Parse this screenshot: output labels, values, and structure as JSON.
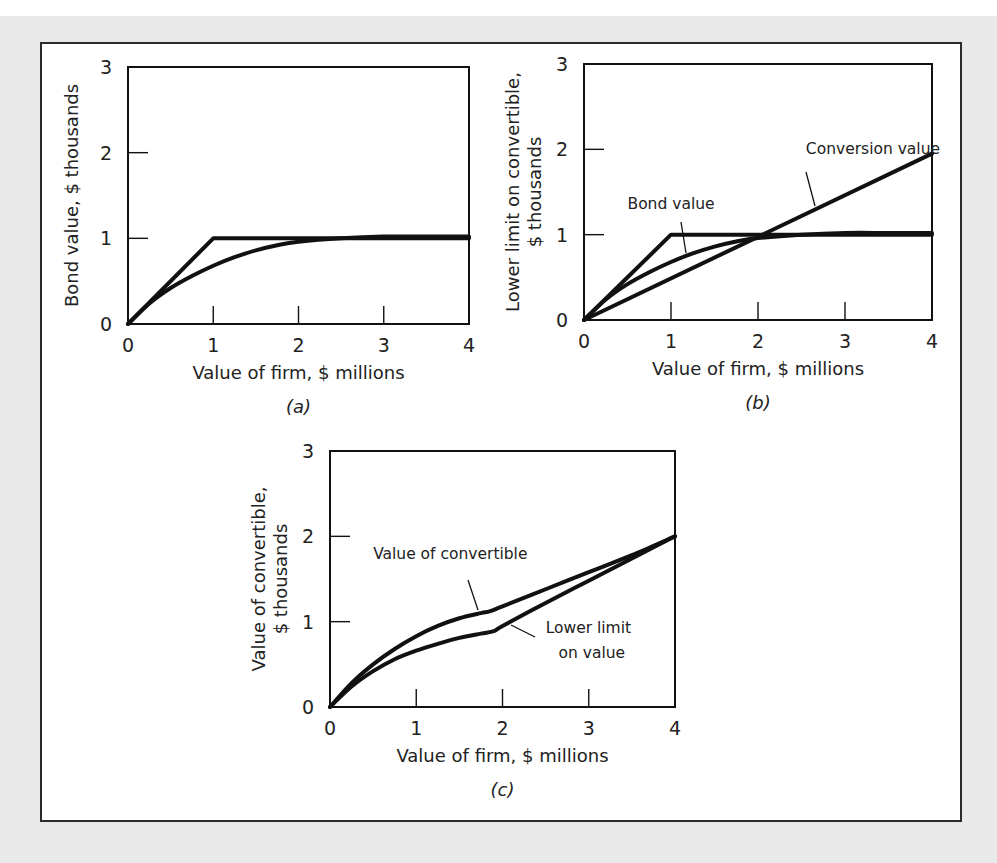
{
  "chart_data": [
    {
      "id": "a",
      "type": "line",
      "panel_label": "(a)",
      "xlabel": "Value of firm, $ millions",
      "ylabel": [
        "Bond value, $ thousands"
      ],
      "xlim": [
        0,
        4
      ],
      "ylim": [
        0,
        3
      ],
      "xticks": [
        0,
        1,
        2,
        3,
        4
      ],
      "yticks": [
        0,
        1,
        2,
        3
      ],
      "grid": false,
      "box": {
        "x0": 128,
        "y0": 67,
        "x1": 469,
        "y1": 324
      },
      "series": [
        {
          "name": "Bond value upper bound (kinked)",
          "x": [
            0,
            1,
            4
          ],
          "y": [
            0,
            1,
            1
          ]
        },
        {
          "name": "Bond value (curve)",
          "x": [
            0,
            0.25,
            0.5,
            0.75,
            1,
            1.25,
            1.5,
            1.75,
            2,
            2.5,
            3,
            3.5,
            4
          ],
          "y": [
            0,
            0.24,
            0.42,
            0.56,
            0.68,
            0.78,
            0.86,
            0.92,
            0.96,
            1.0,
            1.02,
            1.02,
            1.02
          ]
        }
      ],
      "annotations": []
    },
    {
      "id": "b",
      "type": "line",
      "panel_label": "(b)",
      "xlabel": "Value of firm, $ millions",
      "ylabel": [
        "Lower limit on convertible,",
        "$ thousands"
      ],
      "xlim": [
        0,
        4
      ],
      "ylim": [
        0,
        3
      ],
      "xticks": [
        0,
        1,
        2,
        3,
        4
      ],
      "yticks": [
        0,
        1,
        2,
        3
      ],
      "grid": false,
      "box": {
        "x0": 584,
        "y0": 64,
        "x1": 932,
        "y1": 320
      },
      "series": [
        {
          "name": "Bond value upper bound (kinked)",
          "x": [
            0,
            1,
            4
          ],
          "y": [
            0,
            1,
            1
          ]
        },
        {
          "name": "Bond value",
          "x": [
            0,
            0.25,
            0.5,
            0.75,
            1,
            1.25,
            1.5,
            1.75,
            2,
            2.5,
            3,
            3.5,
            4
          ],
          "y": [
            0,
            0.24,
            0.42,
            0.56,
            0.68,
            0.78,
            0.86,
            0.92,
            0.96,
            1.0,
            1.02,
            1.02,
            1.02
          ]
        },
        {
          "name": "Conversion value",
          "x": [
            0,
            4
          ],
          "y": [
            0,
            1.95
          ]
        }
      ],
      "annotations": [
        {
          "text": "Conversion value",
          "x": 2.55,
          "y": 1.95,
          "leader_to": [
            2.6,
            1.3
          ]
        },
        {
          "text": "Bond value",
          "x": 0.5,
          "y": 1.3,
          "leader_to": [
            1.15,
            0.72
          ]
        }
      ]
    },
    {
      "id": "c",
      "type": "line",
      "panel_label": "(c)",
      "xlabel": "Value of firm, $ millions",
      "ylabel": [
        "Value of convertible,",
        "$ thousands"
      ],
      "xlim": [
        0,
        4
      ],
      "ylim": [
        0,
        3
      ],
      "xticks": [
        0,
        1,
        2,
        3,
        4
      ],
      "yticks": [
        0,
        1,
        2,
        3
      ],
      "grid": false,
      "box": {
        "x0": 330,
        "y0": 451,
        "x1": 675,
        "y1": 707
      },
      "series": [
        {
          "name": "Value of convertible",
          "x": [
            0,
            0.25,
            0.5,
            0.75,
            1,
            1.25,
            1.5,
            1.75,
            1.85,
            2,
            2.5,
            3,
            3.5,
            4
          ],
          "y": [
            0,
            0.28,
            0.5,
            0.68,
            0.83,
            0.95,
            1.04,
            1.1,
            1.12,
            1.18,
            1.38,
            1.58,
            1.78,
            2.0
          ]
        },
        {
          "name": "Lower limit on value",
          "x": [
            0,
            0.25,
            0.5,
            0.75,
            1,
            1.25,
            1.5,
            1.75,
            1.9,
            2,
            2.5,
            3,
            3.5,
            4
          ],
          "y": [
            0,
            0.24,
            0.42,
            0.56,
            0.66,
            0.74,
            0.81,
            0.86,
            0.89,
            0.95,
            1.22,
            1.48,
            1.74,
            2.0
          ]
        }
      ],
      "annotations": [
        {
          "text": "Value of convertible",
          "x": 0.5,
          "y": 1.73,
          "leader_to": [
            1.75,
            1.12
          ]
        },
        {
          "text": "Lower limit",
          "x": 2.5,
          "y": 0.87,
          "leader_to": [
            2.05,
            0.97
          ]
        },
        {
          "text": "on value",
          "x": 2.65,
          "y": 0.58
        }
      ]
    }
  ]
}
